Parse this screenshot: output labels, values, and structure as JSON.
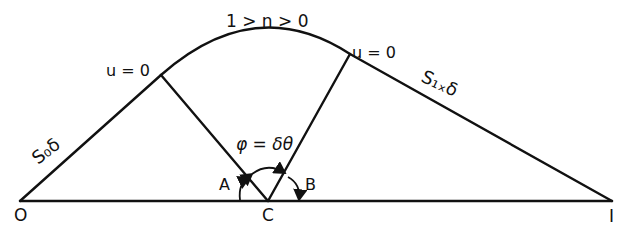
{
  "diagram": {
    "labels": {
      "arc_condition": "1 > n > 0",
      "left_junction": "u = 0",
      "right_junction": "u = 0",
      "left_segment": "S₀δ",
      "right_segment": "S₁ₓδ",
      "angle_relation": "φ = δθ",
      "angle_a": "A",
      "angle_b": "B",
      "point_o": "O",
      "point_c": "C",
      "point_i": "I"
    },
    "colors": {
      "ink": "#111111",
      "background": "#ffffff"
    }
  }
}
